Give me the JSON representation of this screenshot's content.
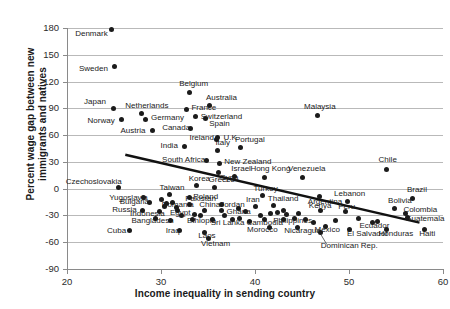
{
  "chart_data": {
    "type": "scatter",
    "title": "",
    "xlabel": "Income inequality in sending country",
    "ylabel": "Percent wage gap between new immigrants and natives",
    "xlim": [
      20,
      60
    ],
    "ylim": [
      -90,
      180
    ],
    "xticks": [
      "20",
      "30",
      "40",
      "50",
      "60"
    ],
    "yticks": [
      "180",
      "150",
      "120",
      "90",
      "60",
      "30",
      "0",
      "-30",
      "-60",
      "-90"
    ],
    "grid": true,
    "legend": "none",
    "trendline": {
      "x0": 26.2,
      "y0": 38,
      "x1": 57.5,
      "y1": -38
    },
    "points": [
      {
        "label": "Denmark",
        "x": 24.7,
        "y": 178,
        "lx": -36,
        "ly": 4
      },
      {
        "label": "Sweden",
        "x": 25.0,
        "y": 137,
        "lx": -35,
        "ly": 3
      },
      {
        "label": "Japan",
        "x": 24.9,
        "y": 90,
        "lx": -29,
        "ly": -6
      },
      {
        "label": "Netherlands",
        "x": 27.9,
        "y": 84,
        "lx": -16,
        "ly": -8
      },
      {
        "label": "Germany",
        "x": 28.3,
        "y": 78,
        "lx": 6,
        "ly": -1
      },
      {
        "label": "Norway",
        "x": 25.8,
        "y": 78,
        "lx": -34,
        "ly": 2
      },
      {
        "label": "Austria",
        "x": 29.1,
        "y": 65,
        "lx": -32,
        "ly": 0
      },
      {
        "label": "Belgium",
        "x": 33.0,
        "y": 108,
        "lx": -10,
        "ly": -8
      },
      {
        "label": "Australia",
        "x": 35.2,
        "y": 93,
        "lx": -4,
        "ly": -8
      },
      {
        "label": "France",
        "x": 32.7,
        "y": 89,
        "lx": 5,
        "ly": -1
      },
      {
        "label": "Switzerland",
        "x": 33.7,
        "y": 81,
        "lx": 5,
        "ly": 1
      },
      {
        "label": "Canada",
        "x": 33.1,
        "y": 67,
        "lx": -28,
        "ly": -1
      },
      {
        "label": "Spain",
        "x": 34.7,
        "y": 79,
        "lx": 4,
        "ly": 6
      },
      {
        "label": "Ireland",
        "x": 35.9,
        "y": 55,
        "lx": -27,
        "ly": -2
      },
      {
        "label": "U.K.",
        "x": 36.0,
        "y": 57,
        "lx": 6,
        "ly": 0
      },
      {
        "label": "India",
        "x": 32.5,
        "y": 47,
        "lx": -24,
        "ly": -1
      },
      {
        "label": "Italy",
        "x": 36.0,
        "y": 43,
        "lx": -2,
        "ly": -7
      },
      {
        "label": "Portugal",
        "x": 38.5,
        "y": 46,
        "lx": -6,
        "ly": -8
      },
      {
        "label": "South Africa",
        "x": 34.8,
        "y": 31,
        "lx": -44,
        "ly": -1
      },
      {
        "label": "New Zealand",
        "x": 36.2,
        "y": 28,
        "lx": 5,
        "ly": -2
      },
      {
        "label": "Syria",
        "x": 36.1,
        "y": 18,
        "lx": 2,
        "ly": 5
      },
      {
        "label": "Israel",
        "x": 37.8,
        "y": 14,
        "lx": -3,
        "ly": -7
      },
      {
        "label": "Hong Kong",
        "x": 41.0,
        "y": 13,
        "lx": -14,
        "ly": -8
      },
      {
        "label": "Venezuela",
        "x": 45.0,
        "y": 13,
        "lx": -14,
        "ly": -8
      },
      {
        "label": "Chile",
        "x": 54.0,
        "y": 22,
        "lx": -8,
        "ly": -9
      },
      {
        "label": "Malaysia",
        "x": 46.6,
        "y": 82,
        "lx": -13,
        "ly": -8
      },
      {
        "label": "Czechoslovakia",
        "x": 25.5,
        "y": 1,
        "lx": -53,
        "ly": -6
      },
      {
        "label": "Korea",
        "x": 33.8,
        "y": 3,
        "lx": -8,
        "ly": -7
      },
      {
        "label": "Greece",
        "x": 35.7,
        "y": 1,
        "lx": -6,
        "ly": -8
      },
      {
        "label": "Turkey",
        "x": 40.8,
        "y": -8,
        "lx": -9,
        "ly": -7
      },
      {
        "label": "Argentina",
        "x": 46.9,
        "y": -9,
        "lx": -12,
        "ly": 5
      },
      {
        "label": "Lebanon",
        "x": 49.8,
        "y": -14,
        "lx": -13,
        "ly": -7
      },
      {
        "label": "Brazil",
        "x": 56.8,
        "y": -11,
        "lx": -6,
        "ly": -8
      },
      {
        "label": "Yugoslavia",
        "x": 28.1,
        "y": -10,
        "lx": -34,
        "ly": 0
      },
      {
        "label": "Taiwan",
        "x": 30.9,
        "y": -6,
        "lx": -10,
        "ly": -6
      },
      {
        "label": "Poland",
        "x": 33.0,
        "y": -10,
        "lx": 4,
        "ly": -1
      },
      {
        "label": "Bulgaria",
        "x": 28.8,
        "y": -15,
        "lx": -30,
        "ly": 0
      },
      {
        "label": "Romania",
        "x": 30.6,
        "y": -17,
        "lx": -5,
        "ly": 1
      },
      {
        "label": "Pakistan",
        "x": 33.0,
        "y": -18,
        "lx": -4,
        "ly": -6
      },
      {
        "label": "Russia",
        "x": 28.0,
        "y": -24,
        "lx": -30,
        "ly": 0
      },
      {
        "label": "Indonesia",
        "x": 29.8,
        "y": -26,
        "lx": -29,
        "ly": 2
      },
      {
        "label": "Egypt",
        "x": 31.8,
        "y": -25,
        "lx": -8,
        "ly": 2
      },
      {
        "label": "China",
        "x": 34.6,
        "y": -24,
        "lx": -5,
        "ly": -5
      },
      {
        "label": "Jordan",
        "x": 36.4,
        "y": -24,
        "lx": -1,
        "ly": -5
      },
      {
        "label": "Iran",
        "x": 40.0,
        "y": -20,
        "lx": -9,
        "ly": -7
      },
      {
        "label": "Thailand",
        "x": 42.0,
        "y": -19,
        "lx": -6,
        "ly": -7
      },
      {
        "label": "Ghana",
        "x": 39.0,
        "y": -26,
        "lx": -19,
        "ly": 0
      },
      {
        "label": "Kenya",
        "x": 47.0,
        "y": -25,
        "lx": -12,
        "ly": -5
      },
      {
        "label": "Peru",
        "x": 49.6,
        "y": -26,
        "lx": -7,
        "ly": -5
      },
      {
        "label": "Bolivia",
        "x": 54.8,
        "y": -22,
        "lx": -6,
        "ly": -7
      },
      {
        "label": "Colombia",
        "x": 56.0,
        "y": -28,
        "lx": -2,
        "ly": -4
      },
      {
        "label": "Guatemala",
        "x": 56.2,
        "y": -32,
        "lx": -2,
        "ly": 2
      },
      {
        "label": "Bangladesh",
        "x": 31.0,
        "y": -36,
        "lx": -39,
        "ly": 0
      },
      {
        "label": "Ethiopia",
        "x": 33.3,
        "y": -34,
        "lx": -5,
        "ly": 2
      },
      {
        "label": "Sri Lanka",
        "x": 35.5,
        "y": -35,
        "lx": -2,
        "ly": 3
      },
      {
        "label": "Cambodia",
        "x": 41.0,
        "y": -35,
        "lx": -18,
        "ly": 3
      },
      {
        "label": "Philippines",
        "x": 43.0,
        "y": -34,
        "lx": -10,
        "ly": 2
      },
      {
        "label": "Cuba",
        "x": 26.6,
        "y": -47,
        "lx": -22,
        "ly": 0
      },
      {
        "label": "Iraq",
        "x": 32.0,
        "y": -47,
        "lx": -14,
        "ly": 0
      },
      {
        "label": "Laos",
        "x": 34.6,
        "y": -49,
        "lx": -6,
        "ly": 4
      },
      {
        "label": "Vietnam",
        "x": 35.0,
        "y": -56,
        "lx": -7,
        "ly": 5
      },
      {
        "label": "Morocco",
        "x": 41.5,
        "y": -43,
        "lx": -22,
        "ly": 3
      },
      {
        "label": "Nicaragua",
        "x": 44.5,
        "y": -43,
        "lx": -13,
        "ly": 4
      },
      {
        "label": "Mexico",
        "x": 47.5,
        "y": -42,
        "lx": -11,
        "ly": 4
      },
      {
        "label": "Ecuador",
        "x": 52.5,
        "y": -38,
        "lx": -13,
        "ly": 3
      },
      {
        "label": "El Salvador",
        "x": 50.0,
        "y": -46,
        "lx": -2,
        "ly": 4
      },
      {
        "label": "Honduras",
        "x": 54.0,
        "y": -46,
        "lx": -8,
        "ly": 4
      },
      {
        "label": "Haiti",
        "x": 58.0,
        "y": -46,
        "lx": -5,
        "ly": 4
      },
      {
        "label": "Dominican Rep.",
        "x": 47.0,
        "y": -49,
        "lx": 0,
        "ly": 14
      }
    ],
    "extra_points": [
      {
        "x": 30.0,
        "y": -12
      },
      {
        "x": 30.4,
        "y": -20
      },
      {
        "x": 31.2,
        "y": -15
      },
      {
        "x": 31.6,
        "y": -21
      },
      {
        "x": 32.2,
        "y": -30
      },
      {
        "x": 33.6,
        "y": -29
      },
      {
        "x": 34.2,
        "y": -30
      },
      {
        "x": 36.8,
        "y": -30
      },
      {
        "x": 37.6,
        "y": -35
      },
      {
        "x": 38.4,
        "y": -33
      },
      {
        "x": 39.4,
        "y": -37
      },
      {
        "x": 40.6,
        "y": -30
      },
      {
        "x": 41.6,
        "y": -28
      },
      {
        "x": 42.4,
        "y": -27
      },
      {
        "x": 43.4,
        "y": -29
      },
      {
        "x": 44.2,
        "y": -33
      },
      {
        "x": 45.4,
        "y": -35
      },
      {
        "x": 46.2,
        "y": -38
      },
      {
        "x": 48.6,
        "y": -36
      },
      {
        "x": 51.0,
        "y": -33
      },
      {
        "x": 53.0,
        "y": -37
      },
      {
        "x": 36.4,
        "y": -18
      },
      {
        "x": 38.2,
        "y": -22
      },
      {
        "x": 43.0,
        "y": -24
      },
      {
        "x": 44.6,
        "y": -28
      },
      {
        "x": 29.4,
        "y": -33
      }
    ]
  }
}
